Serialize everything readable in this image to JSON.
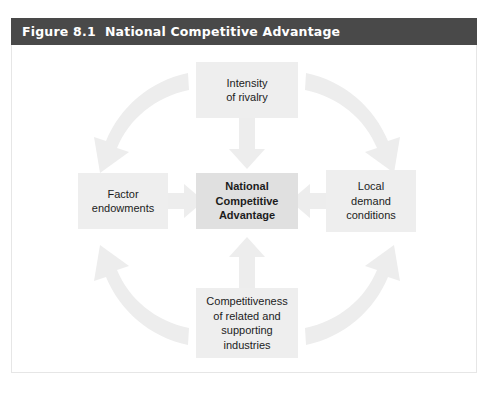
{
  "figure": {
    "title": "Figure 8.1  National Competitive Advantage",
    "title_bar_color": "#494949",
    "title_text_color": "#ffffff",
    "frame_border_color": "#e6e6e6",
    "background_color": "#ffffff"
  },
  "diagram": {
    "type": "diamond-model",
    "box_fill": "#eeeeee",
    "center_box_fill": "#e0e0e0",
    "arrow_fill": "#ededed",
    "text_color": "#1c1c1c",
    "nodes": {
      "rivalry": {
        "label": "Intensity\nof rivalry",
        "position": "top"
      },
      "factor": {
        "label": "Factor\nendowments",
        "position": "left"
      },
      "center": {
        "label": "National\nCompetitive\nAdvantage",
        "position": "center",
        "emphasis": "bold"
      },
      "demand": {
        "label": "Local\ndemand\nconditions",
        "position": "right"
      },
      "related": {
        "label": "Competitiveness\nof related and\nsupporting\nindustries",
        "position": "bottom"
      }
    },
    "connectors": [
      {
        "name": "rivalry-to-center",
        "shape": "straight",
        "direction": "down",
        "from": "rivalry",
        "to": "center"
      },
      {
        "name": "factor-to-center",
        "shape": "straight",
        "direction": "right",
        "from": "factor",
        "to": "center"
      },
      {
        "name": "demand-to-center",
        "shape": "straight",
        "direction": "left",
        "from": "demand",
        "to": "center"
      },
      {
        "name": "related-to-center",
        "shape": "straight",
        "direction": "up",
        "from": "related",
        "to": "center"
      },
      {
        "name": "rivalry-to-factor",
        "shape": "curved",
        "direction": "down-left",
        "from": "rivalry",
        "to": "factor"
      },
      {
        "name": "rivalry-to-demand",
        "shape": "curved",
        "direction": "down-right",
        "from": "rivalry",
        "to": "demand"
      },
      {
        "name": "related-to-factor",
        "shape": "curved",
        "direction": "up-left",
        "from": "related",
        "to": "factor"
      },
      {
        "name": "related-to-demand",
        "shape": "curved",
        "direction": "up-right",
        "from": "related",
        "to": "demand"
      }
    ]
  }
}
